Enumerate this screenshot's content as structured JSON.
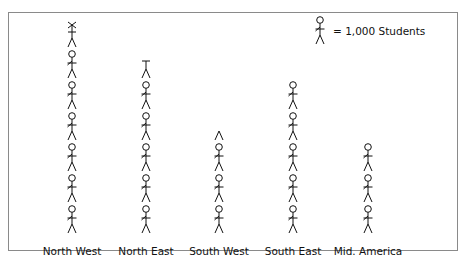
{
  "legend": {
    "icon": "stick-figure-icon",
    "text": "= 1,000 Students",
    "unit_value": 1000
  },
  "colors": {
    "ink": "#111111",
    "frame": "#8a8a8a"
  },
  "chart_data": {
    "type": "pictograph",
    "title": "",
    "unit": "1 figure = 1,000 Students",
    "categories": [
      "North West",
      "North East",
      "South West",
      "South East",
      "Mid. America"
    ],
    "figures": [
      6.75,
      5.5,
      3.25,
      5,
      3
    ],
    "values": [
      6750,
      5500,
      3250,
      5000,
      3000
    ],
    "xlabel": "",
    "ylabel": "Students"
  },
  "columns": [
    {
      "label": "North West",
      "full": 6,
      "partial": 0.75,
      "x": 72
    },
    {
      "label": "North East",
      "full": 5,
      "partial": 0.5,
      "x": 146
    },
    {
      "label": "South West",
      "full": 3,
      "partial": 0.25,
      "x": 219
    },
    {
      "label": "South East",
      "full": 5,
      "partial": 0,
      "x": 293
    },
    {
      "label": "Mid. America",
      "full": 3,
      "partial": 0,
      "x": 368
    }
  ]
}
